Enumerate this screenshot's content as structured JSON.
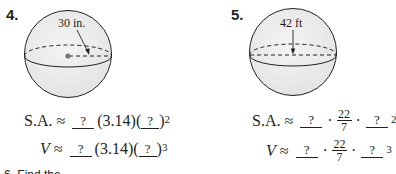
{
  "problems": [
    {
      "number": "4.",
      "figure": {
        "shape": "sphere",
        "label": "30 in.",
        "measure": "radius",
        "shows_center_dot": true
      },
      "surface_area": {
        "lhs": "S.A.",
        "approx": "≈",
        "blank1": "?",
        "pi": "(3.14)",
        "blank2": "?",
        "exponent": "2"
      },
      "volume": {
        "lhs": "V",
        "approx": "≈",
        "blank1": "?",
        "pi": "(3.14)",
        "blank2": "?",
        "exponent": "3"
      }
    },
    {
      "number": "5.",
      "figure": {
        "shape": "sphere",
        "label": "42 ft",
        "measure": "radius",
        "shows_center_dot": false
      },
      "surface_area": {
        "lhs": "S.A.",
        "approx": "≈",
        "blank1": "?",
        "dot": "·",
        "pi_num": "22",
        "pi_den": "7",
        "blank2": "?",
        "exponent": "2"
      },
      "volume": {
        "lhs": "V",
        "approx": "≈",
        "blank1": "?",
        "dot": "·",
        "pi_num": "22",
        "pi_den": "7",
        "blank2": "?",
        "exponent": "3"
      }
    }
  ],
  "cutoff_text": "6. Find the"
}
